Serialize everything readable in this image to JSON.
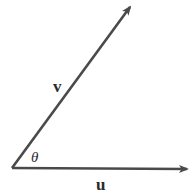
{
  "diagram": {
    "type": "vector-angle",
    "vectors": [
      {
        "name": "v",
        "label": "v",
        "from": [
          12,
          168
        ],
        "to": [
          131,
          6
        ]
      },
      {
        "name": "u",
        "label": "u",
        "from": [
          12,
          168
        ],
        "to": [
          188,
          169
        ]
      }
    ],
    "angle": {
      "label": "θ",
      "between": [
        "u",
        "v"
      ]
    },
    "colors": {
      "stroke": "#4a4a4a",
      "text": "#2b2b2b",
      "background": "#ffffff"
    }
  }
}
